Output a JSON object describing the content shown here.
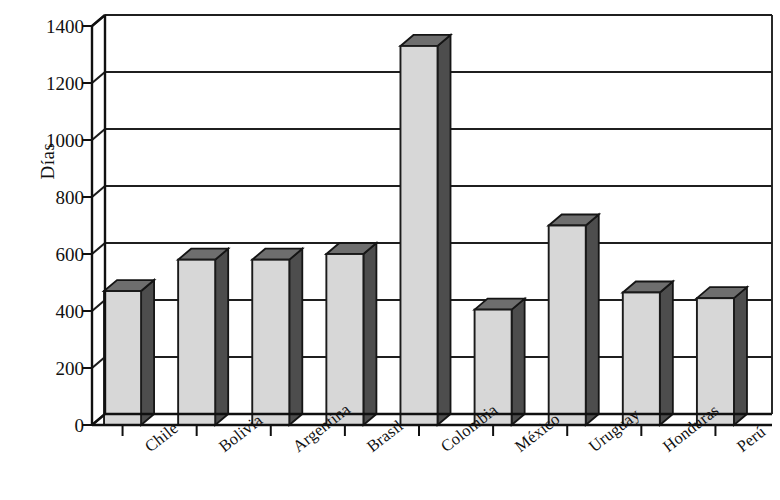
{
  "chart_data": {
    "type": "bar",
    "title": "",
    "subtitle": "",
    "xlabel": "",
    "ylabel": "Días",
    "categories": [
      "Chile",
      "Bolivia",
      "Argentina",
      "Brasil",
      "Colombia",
      "México",
      "Uruguay",
      "Honduras",
      "Perú"
    ],
    "values": [
      470,
      580,
      580,
      600,
      1330,
      405,
      700,
      465,
      445
    ],
    "ylim": [
      0,
      1400
    ],
    "yticks": [
      0,
      200,
      400,
      600,
      800,
      1000,
      1200,
      1400
    ],
    "ytick_labels": [
      "0",
      "200",
      "400",
      "600",
      "800",
      "1000",
      "1200",
      "1400"
    ],
    "grid": true,
    "grid_axis": "y",
    "legend": false,
    "legend_position": "none",
    "style": "3d-bar",
    "bar_face_color": "#d7d7d7",
    "bar_side_color": "#4d4d4d",
    "bar_top_color": "#6e6e6e",
    "axis_color": "#101010",
    "background_color": "#ffffff",
    "xtick_rotation": -38
  },
  "axis": {
    "y_title": "Días"
  }
}
